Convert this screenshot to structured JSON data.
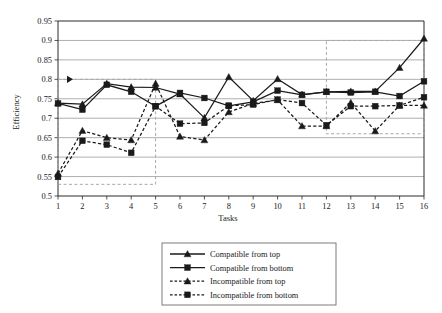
{
  "chart_data": {
    "type": "line",
    "title": "",
    "xlabel": "Tasks",
    "ylabel": "Efficiency",
    "x": [
      1,
      2,
      3,
      4,
      5,
      6,
      7,
      8,
      9,
      10,
      11,
      12,
      13,
      14,
      15,
      16
    ],
    "categories": [
      "1",
      "2",
      "3",
      "4",
      "5",
      "6",
      "7",
      "8",
      "9",
      "10",
      "11",
      "12",
      "13",
      "14",
      "15",
      "16"
    ],
    "xtick_labels": [
      "1",
      "2",
      "3",
      "4",
      "5",
      "6",
      "7",
      "8",
      "9",
      "10",
      "11",
      "12",
      "13",
      "14",
      "15",
      "16"
    ],
    "ytick_labels": [
      "0.5",
      "0.55",
      "0.6",
      "0.65",
      "0.7",
      "0.75",
      "0.8",
      "0.85",
      "0.9",
      "0.95"
    ],
    "ytick_values": [
      0.5,
      0.55,
      0.6,
      0.65,
      0.7,
      0.75,
      0.8,
      0.85,
      0.9,
      0.95
    ],
    "ylim": [
      0.5,
      0.95
    ],
    "xlim": [
      1,
      16
    ],
    "grid": "horizontal",
    "legend_position": "below-center",
    "series": [
      {
        "name": "Compatible from top",
        "marker": "triangle",
        "line_style": "solid",
        "values": [
          0.739,
          0.736,
          0.789,
          0.78,
          0.779,
          0.762,
          0.701,
          0.806,
          0.745,
          0.801,
          0.761,
          0.768,
          0.769,
          0.769,
          0.83,
          0.905
        ]
      },
      {
        "name": "Compatible from bottom",
        "marker": "square",
        "line_style": "solid",
        "values": [
          0.738,
          0.722,
          0.786,
          0.768,
          0.731,
          0.765,
          0.752,
          0.732,
          0.742,
          0.771,
          0.76,
          0.768,
          0.766,
          0.768,
          0.757,
          0.795
        ]
      },
      {
        "name": "Incompatible from top",
        "marker": "triangle",
        "line_style": "dashed",
        "values": [
          0.558,
          0.668,
          0.65,
          0.644,
          0.789,
          0.653,
          0.644,
          0.716,
          0.738,
          0.747,
          0.68,
          0.68,
          0.74,
          0.667,
          0.733,
          0.733
        ]
      },
      {
        "name": "Incompatible from bottom",
        "marker": "square",
        "line_style": "dashed",
        "values": [
          0.549,
          0.642,
          0.632,
          0.611,
          0.731,
          0.686,
          0.688,
          0.732,
          0.735,
          0.748,
          0.739,
          0.682,
          0.731,
          0.731,
          0.733,
          0.754
        ]
      }
    ],
    "annotations": [
      {
        "name": "highlight-box-left",
        "type": "rect-dashed",
        "x_range": [
          1,
          5
        ],
        "y_range": [
          0.53,
          0.8
        ],
        "arrow": "right"
      },
      {
        "name": "highlight-box-right",
        "type": "rect-dashed",
        "x_range": [
          12,
          16
        ],
        "y_range": [
          0.66,
          0.9
        ],
        "arrow": "none"
      }
    ]
  },
  "legend": {
    "items": [
      {
        "label": "Compatible from top"
      },
      {
        "label": "Compatible from bottom"
      },
      {
        "label": "Incompatible from top"
      },
      {
        "label": "Incompatible from bottom"
      }
    ]
  },
  "colors": {
    "ink": "#1a1a1a",
    "grid": "#8d8d8d",
    "annotation": "#a8a8a8",
    "background": "#ffffff"
  }
}
